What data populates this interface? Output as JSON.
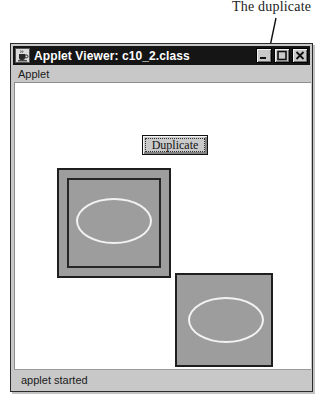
{
  "annotation": {
    "label": "The duplicate",
    "arrow": {
      "from_x": 276,
      "from_y": 18,
      "to_x": 231,
      "to_y": 231,
      "color": "#111111"
    }
  },
  "window": {
    "title": "Applet Viewer: c10_2.class",
    "icon": "coffee-cup-icon",
    "controls": [
      {
        "name": "minimize-button",
        "glyph": "minimize-icon"
      },
      {
        "name": "maximize-button",
        "glyph": "maximize-icon"
      },
      {
        "name": "close-button",
        "glyph": "close-icon"
      }
    ],
    "menu": {
      "items": [
        {
          "label": "Applet"
        }
      ]
    },
    "status": {
      "text": "applet started"
    },
    "colors": {
      "chrome": "#c8c8c8",
      "titlebar": "#151515",
      "titlebar_text": "#ffffff",
      "canvas": "#ffffff",
      "shape_fill": "#9d9d9d",
      "shape_stroke": "#1f1f1f",
      "ellipse_stroke": "#f2f2f2"
    }
  },
  "applet": {
    "button": {
      "label": "Duplicate"
    },
    "shapes": [
      {
        "name": "original",
        "x": 42,
        "y": 85,
        "width": 114,
        "height": 110,
        "has_inner_rect": true,
        "ellipse": {
          "x": 17,
          "y": 28,
          "width": 76,
          "height": 46
        }
      },
      {
        "name": "duplicate",
        "x": 160,
        "y": 190,
        "width": 98,
        "height": 94,
        "has_inner_rect": false,
        "ellipse": {
          "x": 11,
          "y": 22,
          "width": 76,
          "height": 46
        }
      }
    ]
  }
}
